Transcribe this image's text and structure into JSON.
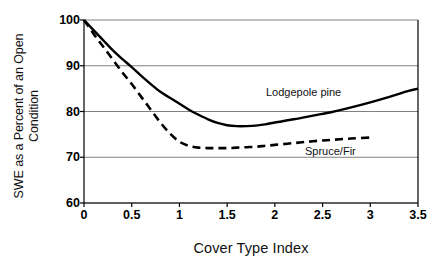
{
  "chart_data": {
    "type": "line",
    "title": "",
    "xlabel": "Cover Type Index",
    "ylabel": "SWE as a Percent of an Open\nCondition",
    "xlim": [
      0,
      3.5
    ],
    "ylim": [
      60,
      100
    ],
    "xticks": [
      "0",
      "0.5",
      "1",
      "1.5",
      "2",
      "2.5",
      "3",
      "3.5"
    ],
    "xtick_values": [
      0,
      0.5,
      1,
      1.5,
      2,
      2.5,
      3,
      3.5
    ],
    "yticks": [
      "60",
      "70",
      "80",
      "90",
      "100"
    ],
    "ytick_values": [
      60,
      70,
      80,
      90,
      100
    ],
    "grid": "horizontal",
    "legend_position": "inline-annotation",
    "series": [
      {
        "name": "Lodgepole pine",
        "style": "solid",
        "color": "#000000",
        "x": [
          0,
          0.1,
          0.2,
          0.3,
          0.4,
          0.5,
          0.6,
          0.7,
          0.8,
          0.9,
          1.0,
          1.1,
          1.2,
          1.3,
          1.4,
          1.5,
          1.6,
          1.7,
          1.8,
          1.9,
          2.0,
          2.2,
          2.4,
          2.6,
          2.8,
          3.0,
          3.2,
          3.4,
          3.5
        ],
        "values": [
          100,
          97.8,
          95.6,
          93.4,
          91.5,
          89.7,
          87.8,
          86.0,
          84.3,
          83.0,
          81.7,
          80.4,
          79.3,
          78.3,
          77.5,
          77.0,
          76.8,
          76.8,
          76.9,
          77.2,
          77.6,
          78.3,
          79.1,
          79.9,
          80.9,
          82.0,
          83.2,
          84.5,
          85.0
        ]
      },
      {
        "name": "Spruce/Fir",
        "style": "dashed",
        "color": "#000000",
        "x": [
          0,
          0.1,
          0.2,
          0.3,
          0.4,
          0.5,
          0.6,
          0.7,
          0.8,
          0.9,
          1.0,
          1.1,
          1.2,
          1.3,
          1.4,
          1.5,
          1.6,
          1.7,
          1.8,
          1.9,
          2.0,
          2.2,
          2.4,
          2.6,
          2.8,
          3.0
        ],
        "values": [
          100,
          97.0,
          94.2,
          91.4,
          88.6,
          86.0,
          83.2,
          80.4,
          77.6,
          75.2,
          73.4,
          72.5,
          72.1,
          72.0,
          72.0,
          72.0,
          72.1,
          72.2,
          72.3,
          72.5,
          72.7,
          73.1,
          73.5,
          73.8,
          74.1,
          74.3
        ]
      }
    ],
    "annotations": [
      {
        "text": "Lodgepole pine",
        "x": 2.3,
        "y": 82.5
      },
      {
        "text": "Spruce/Fir",
        "x": 2.75,
        "y": 69.8
      }
    ]
  },
  "axis": {
    "x_title": "Cover Type Index",
    "y_title": "SWE as a Percent of an Open\nCondition"
  },
  "colors": {
    "ink": "#000000",
    "grid": "#808080",
    "background": "#ffffff"
  }
}
